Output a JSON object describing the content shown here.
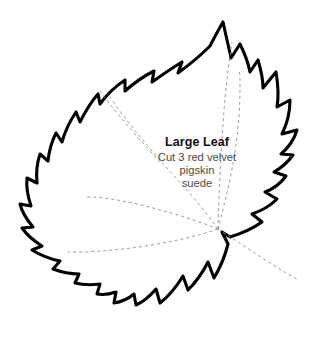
{
  "document": {
    "type": "sewing-pattern-template",
    "background_color": "#ffffff"
  },
  "pattern": {
    "shape_name": "maple-leaf",
    "outline_color": "#000000",
    "fill_color": "#ffffff",
    "vein_color": "#8a8a8a",
    "vein_style": "dashed"
  },
  "label": {
    "title": "Large Leaf",
    "line1": "Cut 3 red velvet",
    "line2": "pigskin",
    "line3": "suede"
  }
}
